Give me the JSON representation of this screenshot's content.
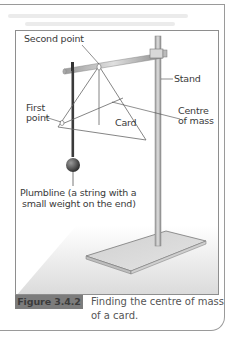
{
  "figure": {
    "labels": {
      "second_point": "Second point",
      "stand": "Stand",
      "first_point_line1": "First",
      "first_point_line2": "point",
      "card": "Card",
      "centre_of_mass_line1": "Centre",
      "centre_of_mass_line2": "of mass",
      "plumbline_line1": "Plumbline (a string with a",
      "plumbline_line2": "small weight on the end)"
    },
    "caption": {
      "tag": "Figure 3.4.2",
      "text": "Finding the centre of mass of a card."
    }
  },
  "colors": {
    "tag_background": "#7c7c7c",
    "frame_border": "#9a9a9a",
    "line_color": "#555555"
  }
}
